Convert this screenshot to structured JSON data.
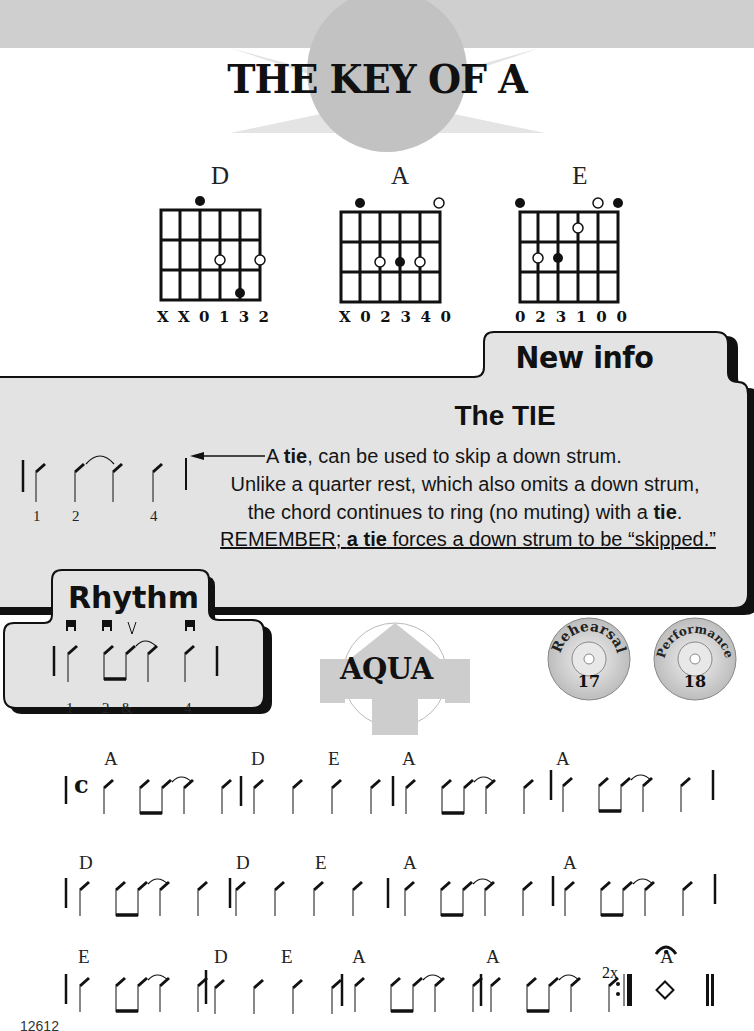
{
  "page": {
    "title": "THE KEY OF A",
    "page_number": "12612"
  },
  "chords": [
    {
      "name": "D",
      "fingering": [
        "X",
        "X",
        "0",
        "1",
        "3",
        "2"
      ]
    },
    {
      "name": "A",
      "fingering": [
        "X",
        "0",
        "2",
        "3",
        "4",
        "0"
      ]
    },
    {
      "name": "E",
      "fingering": [
        "0",
        "2",
        "3",
        "1",
        "0",
        "0"
      ]
    }
  ],
  "new_info": {
    "tab_label": "New info",
    "heading": "The TIE",
    "line1_prefix": "A ",
    "line1_bold": "tie",
    "line1_suffix": ", can be used to skip a down strum.",
    "line2": "Unlike a quarter rest, which also omits a down strum,",
    "line3_prefix": "the chord continues to ring (no muting) with a ",
    "line3_bold": "tie",
    "line3_suffix": ".",
    "remember_prefix": "REMEMBER; ",
    "remember_bold": "a tie",
    "remember_suffix": " forces a down strum to be “skipped.”",
    "example_counts": [
      "1",
      "2",
      "4"
    ]
  },
  "rhythm": {
    "tab_label": "Rhythm",
    "counts": [
      "1",
      "2",
      "&",
      "4"
    ],
    "upstroke_mark": "V"
  },
  "song": {
    "title": "AQUA",
    "time_signature": "c",
    "rehearsal": {
      "label": "Rehearsal",
      "track": "17"
    },
    "performance": {
      "label": "Performance",
      "track": "18"
    },
    "repeat_label": "2x",
    "rows": [
      {
        "chords": [
          {
            "name": "A",
            "x": 104
          },
          {
            "name": "D",
            "x": 253
          },
          {
            "name": "E",
            "x": 330
          },
          {
            "name": "A",
            "x": 403
          },
          {
            "name": "A",
            "x": 557
          }
        ]
      },
      {
        "chords": [
          {
            "name": "D",
            "x": 80
          },
          {
            "name": "D",
            "x": 237
          },
          {
            "name": "E",
            "x": 316
          },
          {
            "name": "A",
            "x": 403
          },
          {
            "name": "A",
            "x": 564
          }
        ]
      },
      {
        "chords": [
          {
            "name": "E",
            "x": 78
          },
          {
            "name": "D",
            "x": 215
          },
          {
            "name": "E",
            "x": 282
          },
          {
            "name": "A",
            "x": 352
          },
          {
            "name": "A",
            "x": 487
          },
          {
            "name": "A",
            "x": 665
          }
        ]
      }
    ]
  },
  "colors": {
    "panel_fill": "#e3e3e3",
    "panel_border": "#111111",
    "band_gray": "#cfcfcf",
    "circle_gray": "#c2c2c2"
  }
}
